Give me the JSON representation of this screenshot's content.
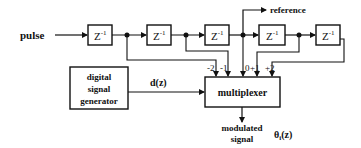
{
  "diagram": {
    "input_label": "pulse",
    "delay_blocks": [
      {
        "label": "Z",
        "exp": "-1"
      },
      {
        "label": "Z",
        "exp": "-1"
      },
      {
        "label": "Z",
        "exp": "-1"
      },
      {
        "label": "Z",
        "exp": "-1"
      },
      {
        "label": "Z",
        "exp": "-1"
      }
    ],
    "reference_label": "reference",
    "generator": {
      "line1": "digital",
      "line2": "signal",
      "line3": "generator"
    },
    "generator_output_label": "d(z)",
    "multiplexer_label": "multiplexer",
    "tap_labels": [
      "-2",
      "-1",
      "0",
      "+1",
      "+2"
    ],
    "output": {
      "line1": "modulated",
      "line2": "signal"
    },
    "theta_label": "θ",
    "theta_sub": "i",
    "theta_suffix": "(z)"
  }
}
